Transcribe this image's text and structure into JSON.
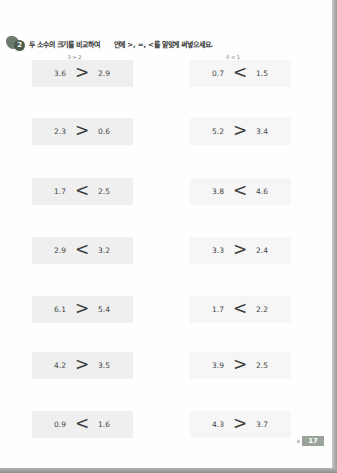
{
  "instruction": {
    "number": "2",
    "text_before": "두 소수의 크기를 비교하여",
    "text_after": "안에 >, =, <를 알맞게 써넣으세요."
  },
  "hints": {
    "left": "3 > 2",
    "right": "0 < 1"
  },
  "problems": [
    {
      "left": {
        "a": "3.6",
        "op": ">",
        "b": "2.9"
      },
      "right": {
        "a": "0.7",
        "op": "<",
        "b": "1.5"
      }
    },
    {
      "left": {
        "a": "2.3",
        "op": ">",
        "b": "0.6"
      },
      "right": {
        "a": "5.2",
        "op": ">",
        "b": "3.4"
      }
    },
    {
      "left": {
        "a": "1.7",
        "op": "<",
        "b": "2.5"
      },
      "right": {
        "a": "3.8",
        "op": "<",
        "b": "4.6"
      }
    },
    {
      "left": {
        "a": "2.9",
        "op": "<",
        "b": "3.2"
      },
      "right": {
        "a": "3.3",
        "op": ">",
        "b": "2.4"
      }
    },
    {
      "left": {
        "a": "6.1",
        "op": ">",
        "b": "5.4"
      },
      "right": {
        "a": "1.7",
        "op": "<",
        "b": "2.2"
      }
    },
    {
      "left": {
        "a": "4.2",
        "op": ">",
        "b": "3.5"
      },
      "right": {
        "a": "3.9",
        "op": ">",
        "b": "2.5"
      }
    },
    {
      "left": {
        "a": "0.9",
        "op": "<",
        "b": "1.6"
      },
      "right": {
        "a": "4.3",
        "op": ">",
        "b": "3.7"
      }
    }
  ],
  "page_number": "17"
}
